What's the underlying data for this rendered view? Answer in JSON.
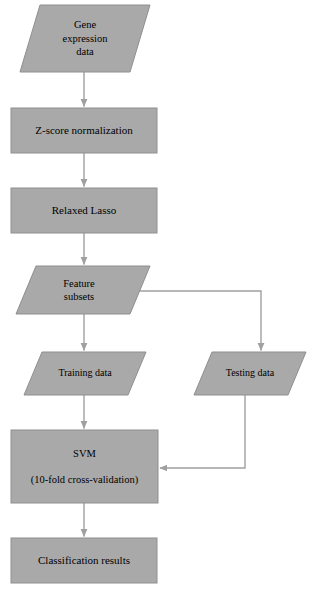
{
  "diagram": {
    "colors": {
      "node_fill": "#a9a9a9",
      "node_stroke": "#8f8f8f",
      "connector": "#a0a0a0",
      "background": "#ffffff",
      "text": "#000000"
    },
    "nodes": [
      {
        "id": "gene-expression-data",
        "shape": "parallelogram",
        "lines": [
          "Gene",
          "expression",
          "data"
        ]
      },
      {
        "id": "z-score-normalization",
        "shape": "rectangle",
        "lines": [
          "Z-score normalization"
        ]
      },
      {
        "id": "relaxed-lasso",
        "shape": "rectangle",
        "lines": [
          "Relaxed Lasso"
        ]
      },
      {
        "id": "feature-subsets",
        "shape": "parallelogram",
        "lines": [
          "Feature",
          "subsets"
        ]
      },
      {
        "id": "training-data",
        "shape": "parallelogram",
        "lines": [
          "Training data"
        ]
      },
      {
        "id": "testing-data",
        "shape": "parallelogram",
        "lines": [
          "Testing data"
        ]
      },
      {
        "id": "svm",
        "shape": "rectangle",
        "lines": [
          "SVM",
          "(10-fold cross-validation)"
        ]
      },
      {
        "id": "classification-results",
        "shape": "rectangle",
        "lines": [
          "Classification results"
        ]
      }
    ],
    "edges": [
      {
        "from": "gene-expression-data",
        "to": "z-score-normalization"
      },
      {
        "from": "z-score-normalization",
        "to": "relaxed-lasso"
      },
      {
        "from": "relaxed-lasso",
        "to": "feature-subsets"
      },
      {
        "from": "feature-subsets",
        "to": "training-data"
      },
      {
        "from": "feature-subsets",
        "to": "testing-data"
      },
      {
        "from": "training-data",
        "to": "svm"
      },
      {
        "from": "testing-data",
        "to": "svm"
      },
      {
        "from": "svm",
        "to": "classification-results"
      }
    ]
  },
  "labels": {
    "gene_line1": "Gene",
    "gene_line2": "expression",
    "gene_line3": "data",
    "zscore": "Z-score normalization",
    "lasso": "Relaxed Lasso",
    "feature_line1": "Feature",
    "feature_line2": "subsets",
    "training": "Training data",
    "testing": "Testing data",
    "svm_line1": "SVM",
    "svm_line2": "(10-fold cross-validation)",
    "results": "Classification results"
  }
}
